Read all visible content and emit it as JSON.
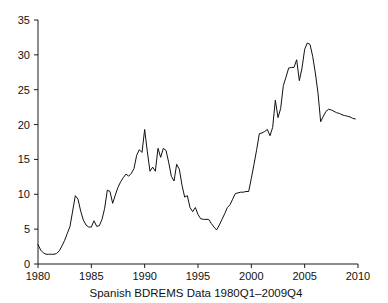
{
  "chart_data": {
    "type": "line",
    "title": "",
    "xlabel": "Spanish BDREMS Data 1980Q1–2009Q4",
    "ylabel": "",
    "xlim": [
      1980,
      2010
    ],
    "ylim": [
      0,
      35
    ],
    "grid": false,
    "legend_position": "none",
    "xticks": [
      1980,
      1985,
      1990,
      1995,
      2000,
      2005,
      2010
    ],
    "xticklabels": [
      "1980",
      "1985",
      "1990",
      "1995",
      "2000",
      "2005",
      "2010"
    ],
    "yticks": [
      0,
      5,
      10,
      15,
      20,
      25,
      30,
      35
    ],
    "yticklabels": [
      "0",
      "5",
      "10",
      "15",
      "20",
      "25",
      "30",
      "35"
    ],
    "line_color": "#111111",
    "series": [
      {
        "name": "Spanish BDREMS",
        "x": [
          1980.0,
          1980.25,
          1980.5,
          1980.75,
          1981.0,
          1981.25,
          1981.5,
          1981.75,
          1982.0,
          1982.25,
          1982.5,
          1982.75,
          1983.0,
          1983.25,
          1983.5,
          1983.75,
          1984.0,
          1984.25,
          1984.5,
          1984.75,
          1985.0,
          1985.25,
          1985.5,
          1985.75,
          1986.0,
          1986.25,
          1986.5,
          1986.75,
          1987.0,
          1987.25,
          1987.5,
          1987.75,
          1988.0,
          1988.25,
          1988.5,
          1988.75,
          1989.0,
          1989.25,
          1989.5,
          1989.75,
          1990.0,
          1990.25,
          1990.5,
          1990.75,
          1991.0,
          1991.25,
          1991.5,
          1991.75,
          1992.0,
          1992.25,
          1992.5,
          1992.75,
          1993.0,
          1993.25,
          1993.5,
          1993.75,
          1994.0,
          1994.25,
          1994.5,
          1994.75,
          1995.0,
          1995.25,
          1995.5,
          1995.75,
          1996.0,
          1996.25,
          1996.5,
          1996.75,
          1997.0,
          1997.25,
          1997.5,
          1997.75,
          1998.0,
          1998.25,
          1998.5,
          1998.75,
          1999.0,
          1999.25,
          1999.5,
          1999.75,
          2000.0,
          2000.25,
          2000.5,
          2000.75,
          2001.0,
          2001.25,
          2001.5,
          2001.75,
          2002.0,
          2002.25,
          2002.5,
          2002.75,
          2003.0,
          2003.25,
          2003.5,
          2003.75,
          2004.0,
          2004.25,
          2004.5,
          2004.75,
          2005.0,
          2005.25,
          2005.5,
          2005.75,
          2006.0,
          2006.25,
          2006.5,
          2006.75,
          2007.0,
          2007.25,
          2007.5,
          2007.75,
          2008.0,
          2008.25,
          2008.5,
          2008.75,
          2009.0,
          2009.25,
          2009.5,
          2009.75
        ],
        "values": [
          2.8,
          2.0,
          1.6,
          1.4,
          1.4,
          1.4,
          1.4,
          1.5,
          1.9,
          2.6,
          3.4,
          4.4,
          5.4,
          7.6,
          9.8,
          9.3,
          7.6,
          6.3,
          5.6,
          5.3,
          5.3,
          6.2,
          5.4,
          5.5,
          6.4,
          8.0,
          10.6,
          10.4,
          8.7,
          9.9,
          11.0,
          11.8,
          12.4,
          12.9,
          12.6,
          13.0,
          13.7,
          15.6,
          16.4,
          16.0,
          19.3,
          16.1,
          13.3,
          13.9,
          13.3,
          16.6,
          15.3,
          16.6,
          16.3,
          14.6,
          12.6,
          11.9,
          14.3,
          13.6,
          11.3,
          9.6,
          9.8,
          8.1,
          7.5,
          8.1,
          7.1,
          6.5,
          6.4,
          6.4,
          6.4,
          5.8,
          5.3,
          4.9,
          5.6,
          6.4,
          7.2,
          8.1,
          8.5,
          9.3,
          10.1,
          10.2,
          10.3,
          10.3,
          10.4,
          10.4,
          12.3,
          14.3,
          16.4,
          18.7,
          18.8,
          19.0,
          19.3,
          18.4,
          19.6,
          23.5,
          21.0,
          22.3,
          25.6,
          26.8,
          28.1,
          28.2,
          28.2,
          29.3,
          26.3,
          28.1,
          30.8,
          31.7,
          31.5,
          29.8,
          27.4,
          24.5,
          20.4,
          21.2,
          21.9,
          22.2,
          22.1,
          21.9,
          21.7,
          21.6,
          21.4,
          21.3,
          21.2,
          21.1,
          20.9,
          20.8
        ]
      }
    ]
  },
  "plot_geometry": {
    "left": 38,
    "right": 358,
    "top": 20,
    "bottom": 264
  }
}
